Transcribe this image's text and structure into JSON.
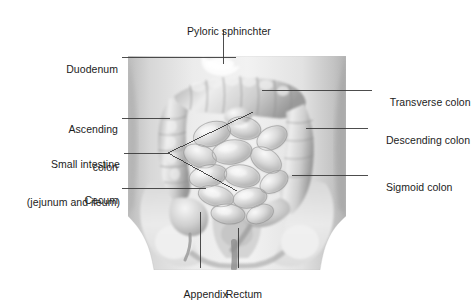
{
  "figure": {
    "background_color": "#ffffff",
    "text_color": "#1c1c1c",
    "leader_color": "#3a3a3a",
    "illustration": {
      "style": "grayscale airbrush medical illustration",
      "region": "anterior abdomen and pelvis",
      "visible_structures": [
        "torso outline",
        "transverse colon",
        "ascending colon",
        "descending colon",
        "sigmoid colon",
        "coils of small intestine",
        "cecum",
        "appendix",
        "rectum",
        "iliac bones of pelvis",
        "sacrum",
        "femoral heads"
      ],
      "tone_light": "#f2f2f2",
      "tone_mid": "#c9c9c9",
      "tone_dark": "#8e8e8e"
    },
    "labels": [
      {
        "id": "pyloric-sphincter",
        "text": "Pyloric sphinchter",
        "align": "center"
      },
      {
        "id": "duodenum",
        "text": "Duodenum",
        "align": "right"
      },
      {
        "id": "ascending-colon",
        "line1": "Ascending",
        "line2": "colon",
        "align": "right"
      },
      {
        "id": "small-intestine",
        "line1": "Small intestine",
        "line2": "(jejunum and ileum)",
        "align": "right"
      },
      {
        "id": "cecum",
        "text": "Cecum",
        "align": "right"
      },
      {
        "id": "transverse-colon",
        "text": "Transverse colon",
        "align": "left"
      },
      {
        "id": "descending-colon",
        "text": "Descending colon",
        "align": "left"
      },
      {
        "id": "sigmoid-colon",
        "text": "Sigmoid colon",
        "align": "left"
      },
      {
        "id": "appendix",
        "text": "Appendix",
        "align": "center"
      },
      {
        "id": "rectum",
        "text": "Rectum",
        "align": "center"
      }
    ]
  }
}
